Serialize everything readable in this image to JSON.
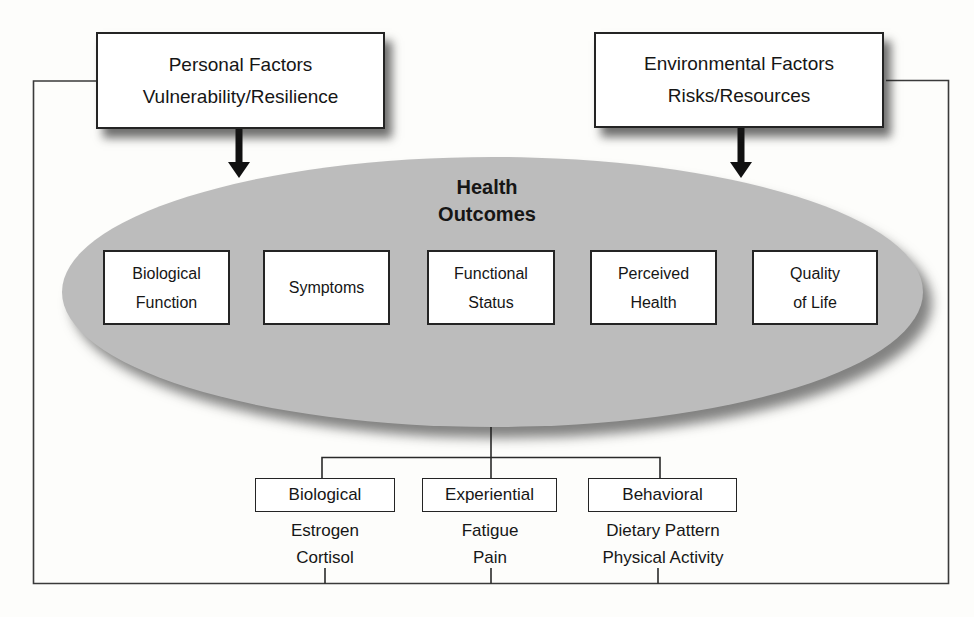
{
  "colors": {
    "ellipse_fill": "#bcbcbc",
    "line_color": "#3a3a3a",
    "arrow_color": "#111111",
    "box_border": "#242424",
    "box_bg": "#ffffff"
  },
  "personal_factors": {
    "line1": "Personal Factors",
    "line2": "Vulnerability/Resilience"
  },
  "environmental_factors": {
    "line1": "Environmental Factors",
    "line2": "Risks/Resources"
  },
  "health_outcomes": {
    "title_line1": "Health",
    "title_line2": "Outcomes",
    "outcome_boxes": [
      {
        "line1": "Biological",
        "line2": "Function"
      },
      {
        "line1": "Symptoms"
      },
      {
        "line1": "Functional",
        "line2": "Status"
      },
      {
        "line1": "Perceived",
        "line2": "Health"
      },
      {
        "line1": "Quality",
        "line2": "of Life"
      }
    ]
  },
  "branches": [
    {
      "label": "Biological",
      "item1": "Estrogen",
      "item2": "Cortisol"
    },
    {
      "label": "Experiential",
      "item1": "Fatigue",
      "item2": "Pain"
    },
    {
      "label": "Behavioral",
      "item1": "Dietary Pattern",
      "item2": "Physical Activity"
    }
  ]
}
